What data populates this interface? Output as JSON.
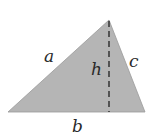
{
  "diagram": {
    "fill_color": "#b5b5b5",
    "edge_color": "#9a9a9a",
    "altitude_color": "#2a2a2a",
    "vertices": {
      "left": [
        8,
        112
      ],
      "apex": [
        109,
        20
      ],
      "right": [
        145,
        112
      ]
    },
    "altitude": {
      "x": 109,
      "y_top": 20,
      "y_bottom": 112,
      "style": "dashed"
    },
    "labels": {
      "a": "a",
      "b": "b",
      "c": "c",
      "h": "h"
    }
  }
}
